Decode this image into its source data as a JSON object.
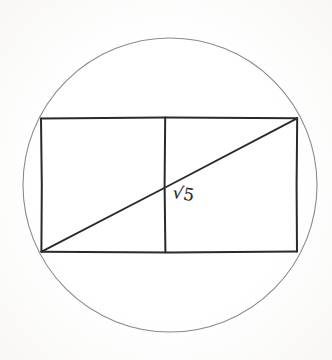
{
  "figure": {
    "background_color": "#fefefe",
    "canvas": {
      "width": 332,
      "height": 360
    },
    "circle": {
      "name": "circumscribed-circle",
      "cx": 170,
      "cy": 185,
      "r": 147,
      "stroke_color": "#8a8a8a",
      "stroke_width": 1.1
    },
    "rectangle": {
      "name": "inscribed-rectangle",
      "x": 41,
      "y": 118,
      "width": 256,
      "height": 134,
      "stroke_color": "#2a2a2a",
      "stroke_width": 2.0,
      "corners": {
        "top_left": [
          41,
          118
        ],
        "top_right": [
          297,
          118
        ],
        "bottom_right": [
          297,
          252
        ],
        "bottom_left": [
          41,
          252
        ]
      }
    },
    "divider": {
      "name": "vertical-divider",
      "x": 165,
      "y1": 118,
      "y2": 252,
      "stroke_color": "#2a2a2a",
      "stroke_width": 2.0
    },
    "diagonal": {
      "name": "diagonal-line",
      "x1": 41,
      "y1": 252,
      "x2": 297,
      "y2": 118,
      "stroke_color": "#2a2a2a",
      "stroke_width": 1.9
    },
    "label": {
      "name": "diagonal-length-label",
      "text": "√5",
      "value": "√5",
      "x": 174,
      "y": 184,
      "rotation_deg": 9,
      "color": "#2b2b2b",
      "font_size": 17
    }
  },
  "chart_data": {
    "type": "diagram",
    "annotations": [
      "√5"
    ],
    "shapes": [
      {
        "shape": "circle",
        "label": "circumscribed-circle",
        "center": [
          170,
          185
        ],
        "radius": 147
      },
      {
        "shape": "rectangle",
        "label": "inscribed-rectangle",
        "top_left": [
          41,
          118
        ],
        "bottom_right": [
          297,
          252
        ],
        "aspect_ratio": "2:1"
      },
      {
        "shape": "line",
        "label": "vertical-divider",
        "from": [
          165,
          118
        ],
        "to": [
          165,
          252
        ]
      },
      {
        "shape": "line",
        "label": "diagonal",
        "from": [
          41,
          252
        ],
        "to": [
          297,
          118
        ],
        "length_label": "√5"
      }
    ]
  }
}
